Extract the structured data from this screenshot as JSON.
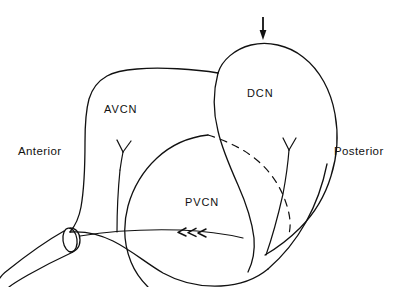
{
  "figure": {
    "type": "line-diagram",
    "background_color": "#ffffff",
    "line_color": "#111111"
  },
  "regions": [
    {
      "id": "avcn",
      "label": "AVCN",
      "name": "anteroventral cochlear nucleus"
    },
    {
      "id": "dcn",
      "label": "DCN",
      "name": "dorsal cochlear nucleus"
    },
    {
      "id": "pvcn",
      "label": "PVCN",
      "name": "posteroventral cochlear nucleus"
    }
  ],
  "orientation": {
    "left_label": "Anterior",
    "right_label": "Posterior"
  },
  "markers": {
    "top_arrow": "down-arrow",
    "fiber_arrowheads": 3,
    "fiber_arrow_direction": "left"
  },
  "elements": {
    "nerve_root": "cut-auditory-nerve-stump",
    "hidden_boundary": "dashed-occluded-border",
    "branching_fibers": 2
  }
}
